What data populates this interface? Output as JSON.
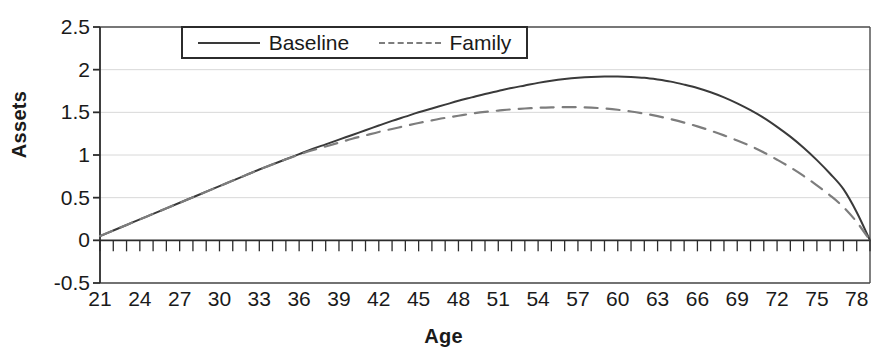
{
  "chart_data": {
    "type": "line",
    "title": "",
    "xlabel": "Age",
    "ylabel": "Assets",
    "xlim": [
      21,
      79
    ],
    "ylim": [
      -0.5,
      2.5
    ],
    "grid": true,
    "legend_position": "top-center",
    "x_tick_labels": [
      "21",
      "24",
      "27",
      "30",
      "33",
      "36",
      "39",
      "42",
      "45",
      "48",
      "51",
      "54",
      "57",
      "60",
      "63",
      "66",
      "69",
      "72",
      "75",
      "78"
    ],
    "x_tick_values": [
      21,
      24,
      27,
      30,
      33,
      36,
      39,
      42,
      45,
      48,
      51,
      54,
      57,
      60,
      63,
      66,
      69,
      72,
      75,
      78
    ],
    "y_tick_labels": [
      "2.5",
      "2",
      "1.5",
      "1",
      "0.5",
      "0",
      "-0.5"
    ],
    "y_tick_values": [
      2.5,
      2,
      1.5,
      1,
      0.5,
      0,
      -0.5
    ],
    "minor_x_ticks_every": 1,
    "x": [
      21,
      22,
      23,
      24,
      25,
      26,
      27,
      28,
      29,
      30,
      31,
      32,
      33,
      34,
      35,
      36,
      37,
      38,
      39,
      40,
      41,
      42,
      43,
      44,
      45,
      46,
      47,
      48,
      49,
      50,
      51,
      52,
      53,
      54,
      55,
      56,
      57,
      58,
      59,
      60,
      61,
      62,
      63,
      64,
      65,
      66,
      67,
      68,
      69,
      70,
      71,
      72,
      73,
      74,
      75,
      76,
      77,
      78,
      79
    ],
    "series": [
      {
        "name": "Baseline",
        "style": "solid",
        "color": "#3a3a3a",
        "values": [
          0.05,
          0.115,
          0.18,
          0.245,
          0.31,
          0.375,
          0.44,
          0.505,
          0.57,
          0.635,
          0.7,
          0.765,
          0.83,
          0.89,
          0.95,
          1.01,
          1.07,
          1.125,
          1.18,
          1.235,
          1.29,
          1.345,
          1.4,
          1.45,
          1.5,
          1.545,
          1.59,
          1.635,
          1.675,
          1.715,
          1.75,
          1.785,
          1.815,
          1.845,
          1.87,
          1.89,
          1.905,
          1.915,
          1.92,
          1.92,
          1.915,
          1.905,
          1.885,
          1.86,
          1.825,
          1.785,
          1.735,
          1.675,
          1.605,
          1.525,
          1.435,
          1.33,
          1.215,
          1.085,
          0.94,
          0.78,
          0.6,
          0.33,
          0.0
        ]
      },
      {
        "name": "Family",
        "style": "dashed",
        "color": "#7d7d7d",
        "values": [
          0.05,
          0.115,
          0.18,
          0.245,
          0.31,
          0.375,
          0.44,
          0.505,
          0.57,
          0.635,
          0.7,
          0.765,
          0.83,
          0.89,
          0.95,
          1.005,
          1.055,
          1.1,
          1.145,
          1.19,
          1.23,
          1.27,
          1.305,
          1.34,
          1.375,
          1.405,
          1.435,
          1.46,
          1.485,
          1.505,
          1.52,
          1.535,
          1.545,
          1.553,
          1.558,
          1.56,
          1.56,
          1.555,
          1.545,
          1.53,
          1.51,
          1.485,
          1.455,
          1.42,
          1.38,
          1.335,
          1.285,
          1.23,
          1.17,
          1.105,
          1.03,
          0.945,
          0.855,
          0.755,
          0.645,
          0.525,
          0.39,
          0.215,
          0.0
        ]
      }
    ]
  },
  "axis": {
    "y_title": "Assets",
    "x_title": "Age"
  },
  "legend": {
    "entries": [
      {
        "label": "Baseline",
        "style": "solid"
      },
      {
        "label": "Family",
        "style": "dashed"
      }
    ]
  }
}
